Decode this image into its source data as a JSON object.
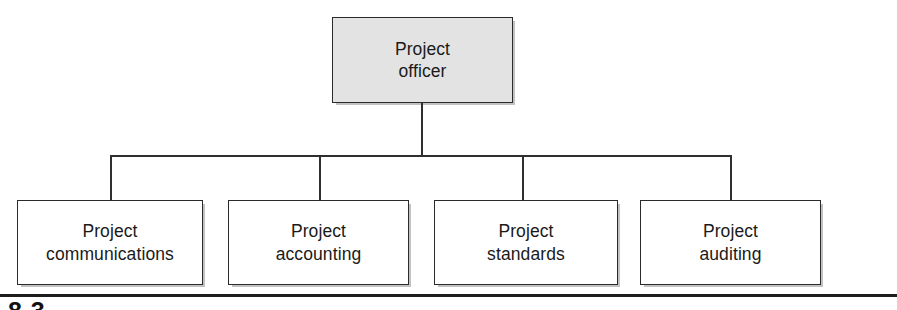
{
  "diagram": {
    "type": "organizational-chart",
    "orientation": "top-down",
    "colors": {
      "root_fill": "#e3e3e3",
      "child_fill": "#ffffff",
      "border": "#2b2b2b",
      "connector": "#2f2f2f",
      "text": "#1a1a1a",
      "rule": "#1d1d1d"
    },
    "root": {
      "id": "project-officer",
      "label": "Project\nofficer",
      "line1": "Project",
      "line2": "officer",
      "fill": "#e3e3e3"
    },
    "children": [
      {
        "id": "project-communications",
        "label": "Project\ncommunications",
        "line1": "Project",
        "line2": "communications",
        "fill": "#ffffff"
      },
      {
        "id": "project-accounting",
        "label": "Project\naccounting",
        "line1": "Project",
        "line2": "accounting",
        "fill": "#ffffff"
      },
      {
        "id": "project-standards",
        "label": "Project\nstandards",
        "line1": "Project",
        "line2": "standards",
        "fill": "#ffffff"
      },
      {
        "id": "project-auditing",
        "label": "Project\nauditing",
        "line1": "Project",
        "line2": "auditing",
        "fill": "#ffffff"
      }
    ]
  },
  "footer": {
    "caption": "8.3"
  }
}
